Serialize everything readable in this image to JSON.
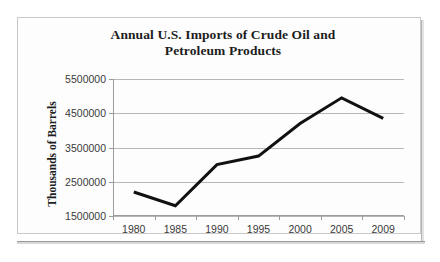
{
  "figure": {
    "frame_border_color": "#c9c9c9",
    "background_color": "#fdfdfd"
  },
  "chart_data": {
    "type": "line",
    "title": "Annual U.S. Imports of Crude Oil and Petroleum Products",
    "title_line1": "Annual U.S. Imports of Crude Oil and",
    "title_line2": "Petroleum Products",
    "xlabel": "",
    "ylabel": "Thousands  of Barrels",
    "categories": [
      "1980",
      "1985",
      "1990",
      "1995",
      "2000",
      "2005",
      "2009"
    ],
    "values": [
      2200000,
      1800000,
      3000000,
      3250000,
      4200000,
      4950000,
      4350000
    ],
    "series": [
      {
        "name": "Annual U.S. Imports of Crude Oil and Petroleum Products",
        "values": [
          2200000,
          1800000,
          3000000,
          3250000,
          4200000,
          4950000,
          4350000
        ],
        "color": "#111111"
      }
    ],
    "ylim": [
      1500000,
      5500000
    ],
    "y_ticks": [
      "1500000",
      "2500000",
      "3500000",
      "4500000",
      "5500000"
    ],
    "y_tick_values": [
      1500000,
      2500000,
      3500000,
      4500000,
      5500000
    ],
    "x_ticks": [
      "1980",
      "1985",
      "1990",
      "1995",
      "2000",
      "2005",
      "2009"
    ],
    "grid": true,
    "grid_color": "#b8b8b8",
    "legend": false,
    "legend_position": "none",
    "line_color": "#111111",
    "line_width": 3,
    "markers": false
  }
}
